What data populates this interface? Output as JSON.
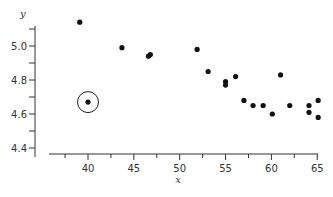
{
  "chart_data": {
    "type": "scatter",
    "title": "",
    "xlabel": "x",
    "ylabel": "y",
    "xlim": [
      36,
      65
    ],
    "ylim": [
      4.38,
      5.18
    ],
    "x_ticks": [
      40,
      45,
      50,
      55,
      60,
      65
    ],
    "x_tick_labels": [
      "40",
      "45",
      "50",
      "55",
      "60",
      "65"
    ],
    "x_minor_ticks": [
      37.5,
      42.5,
      47.5,
      52.5,
      57.5,
      62.5
    ],
    "y_ticks": [
      4.4,
      4.6,
      4.8,
      5.0
    ],
    "y_tick_labels": [
      "4.4",
      "4.6",
      "4.8",
      "5.0"
    ],
    "y_minor_ticks": [
      4.5,
      4.7,
      4.9,
      5.1
    ],
    "grid": false,
    "legend": null,
    "series": [
      {
        "name": "data",
        "color": "#111111",
        "points": [
          {
            "x": 39.1,
            "y": 5.14
          },
          {
            "x": 40.0,
            "y": 4.67,
            "highlighted": true
          },
          {
            "x": 43.7,
            "y": 4.99
          },
          {
            "x": 46.6,
            "y": 4.94
          },
          {
            "x": 46.8,
            "y": 4.95
          },
          {
            "x": 51.9,
            "y": 4.98
          },
          {
            "x": 53.1,
            "y": 4.85
          },
          {
            "x": 55.0,
            "y": 4.77
          },
          {
            "x": 55.0,
            "y": 4.79
          },
          {
            "x": 56.1,
            "y": 4.82
          },
          {
            "x": 57.0,
            "y": 4.68
          },
          {
            "x": 58.0,
            "y": 4.65
          },
          {
            "x": 59.1,
            "y": 4.65
          },
          {
            "x": 60.1,
            "y": 4.6
          },
          {
            "x": 61.0,
            "y": 4.83
          },
          {
            "x": 62.0,
            "y": 4.65
          },
          {
            "x": 64.1,
            "y": 4.65
          },
          {
            "x": 64.1,
            "y": 4.61
          },
          {
            "x": 65.1,
            "y": 4.68
          },
          {
            "x": 65.1,
            "y": 4.58
          }
        ]
      }
    ],
    "annotations": [
      {
        "type": "circle",
        "x": 40.0,
        "y": 4.67,
        "note": "outlier ring around highlighted point"
      }
    ]
  }
}
